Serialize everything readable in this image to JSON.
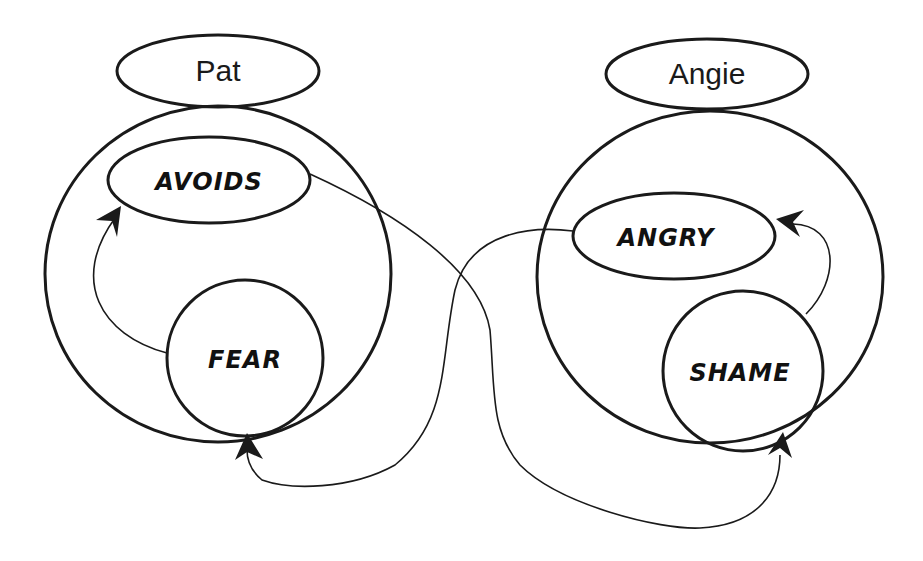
{
  "diagram": {
    "persons": [
      {
        "name": "Pat",
        "emotions": {
          "behavior": "AVOIDS",
          "feeling": "FEAR"
        }
      },
      {
        "name": "Angie",
        "emotions": {
          "behavior": "ANGRY",
          "feeling": "SHAME"
        }
      }
    ],
    "connections": [
      {
        "from": "Pat.FEAR",
        "to": "Pat.AVOIDS"
      },
      {
        "from": "Angie.SHAME",
        "to": "Angie.ANGRY"
      },
      {
        "from": "Pat.AVOIDS",
        "to": "Angie.SHAME"
      },
      {
        "from": "Angie.ANGRY",
        "to": "Pat.FEAR"
      }
    ],
    "colors": {
      "stroke": "#1a1a1a",
      "background": "#ffffff"
    }
  }
}
